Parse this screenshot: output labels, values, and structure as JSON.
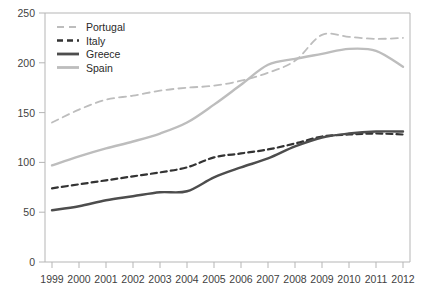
{
  "chart_data": {
    "type": "line",
    "title": "",
    "subtitle": "",
    "xlabel": "",
    "ylabel": "",
    "x": [
      1999,
      2000,
      2001,
      2002,
      2003,
      2004,
      2005,
      2006,
      2007,
      2008,
      2009,
      2010,
      2011,
      2012
    ],
    "categories": [
      "1999",
      "2000",
      "2001",
      "2002",
      "2003",
      "2004",
      "2005",
      "2006",
      "2007",
      "2008",
      "2009",
      "2010",
      "2011",
      "2012"
    ],
    "xlim": [
      1999,
      2012
    ],
    "ylim": [
      0,
      250
    ],
    "yticks": [
      0,
      50,
      100,
      150,
      200,
      250
    ],
    "ytick_labels": [
      "0",
      "50",
      "100",
      "150",
      "200",
      "250"
    ],
    "grid": false,
    "legend_position": "top-left",
    "series": [
      {
        "name": "Portugal",
        "color": "#bdbdbd",
        "style": "dashed",
        "width": 1.8,
        "values": [
          140,
          153,
          163,
          167,
          172,
          175,
          177,
          182,
          190,
          202,
          228,
          226,
          224,
          225
        ]
      },
      {
        "name": "Italy",
        "color": "#333333",
        "style": "dashed",
        "width": 2.2,
        "values": [
          74,
          78,
          82,
          86,
          90,
          95,
          105,
          109,
          113,
          119,
          126,
          128,
          129,
          128
        ]
      },
      {
        "name": "Greece",
        "color": "#4d4d4d",
        "style": "solid",
        "width": 2.4,
        "values": [
          52,
          56,
          62,
          66,
          70,
          71,
          85,
          95,
          104,
          116,
          125,
          129,
          131,
          131
        ]
      },
      {
        "name": "Spain",
        "color": "#bdbdbd",
        "style": "solid",
        "width": 2.4,
        "values": [
          97,
          106,
          114,
          121,
          129,
          140,
          158,
          178,
          198,
          204,
          209,
          214,
          212,
          196
        ]
      }
    ]
  },
  "legend": {
    "entries": [
      {
        "label": "Portugal"
      },
      {
        "label": "Italy"
      },
      {
        "label": "Greece"
      },
      {
        "label": "Spain"
      }
    ]
  },
  "axes": {
    "y_labels": [
      "250",
      "200",
      "150",
      "100",
      "50",
      "0"
    ],
    "x_labels": [
      "1999",
      "2000",
      "2001",
      "2002",
      "2003",
      "2004",
      "2005",
      "2006",
      "2007",
      "2008",
      "2009",
      "2010",
      "2011",
      "2012"
    ]
  },
  "colors": {
    "axis": "#b5b5b5",
    "tick_text": "#3f3f3f",
    "light_series": "#bdbdbd",
    "dark_series": "#333333",
    "greece_series": "#4d4d4d",
    "background": "#ffffff"
  }
}
